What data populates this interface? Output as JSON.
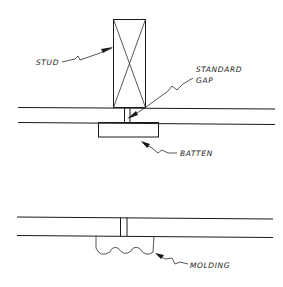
{
  "diagram": {
    "type": "technical-drawing",
    "details": [
      {
        "name": "batten-joint",
        "labels": {
          "stud": "STUD",
          "gap_line1": "STANDARD",
          "gap_line2": "GAP",
          "batten": "BATTEN"
        }
      },
      {
        "name": "molding-joint",
        "labels": {
          "molding": "MOLDING"
        }
      }
    ],
    "colors": {
      "background": "#ffffff",
      "ink": "#1a1a1a"
    }
  }
}
